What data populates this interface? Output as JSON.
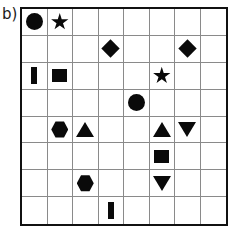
{
  "figure": {
    "panel_label": "b)",
    "grid": {
      "rows": 8,
      "columns": 8,
      "border_color": "#111111",
      "gridline_color": "#8a8a8a",
      "shape_color": "#0a0a0a",
      "background_color": "#ffffff"
    }
  },
  "chart_data": {
    "type": "heatmap",
    "title": "b)",
    "xlabel": "",
    "ylabel": "",
    "grid": true,
    "legend": "none",
    "x": [
      1,
      2,
      3,
      4,
      5,
      6,
      7,
      8
    ],
    "y": [
      1,
      2,
      3,
      4,
      5,
      6,
      7,
      8
    ],
    "xlim": [
      1,
      8
    ],
    "ylim": [
      1,
      8
    ],
    "cell_symbols": [
      [
        "circle",
        "star",
        "",
        "",
        "",
        "",
        "",
        ""
      ],
      [
        "",
        "",
        "",
        "diamond",
        "",
        "",
        "diamond",
        ""
      ],
      [
        "bar",
        "square",
        "",
        "",
        "",
        "star",
        "",
        ""
      ],
      [
        "",
        "",
        "",
        "",
        "circle",
        "",
        "",
        ""
      ],
      [
        "",
        "hexagon",
        "triangle-up",
        "",
        "",
        "triangle-up",
        "triangle-down",
        ""
      ],
      [
        "",
        "",
        "",
        "",
        "",
        "square",
        "",
        ""
      ],
      [
        "",
        "",
        "hexagon",
        "",
        "",
        "triangle-down",
        "",
        ""
      ],
      [
        "",
        "",
        "",
        "bar",
        "",
        "",
        "",
        ""
      ]
    ],
    "markers": [
      {
        "row": 1,
        "col": 1,
        "shape": "circle"
      },
      {
        "row": 1,
        "col": 2,
        "shape": "star"
      },
      {
        "row": 2,
        "col": 4,
        "shape": "diamond"
      },
      {
        "row": 2,
        "col": 7,
        "shape": "diamond"
      },
      {
        "row": 3,
        "col": 1,
        "shape": "bar"
      },
      {
        "row": 3,
        "col": 2,
        "shape": "square"
      },
      {
        "row": 3,
        "col": 6,
        "shape": "star"
      },
      {
        "row": 4,
        "col": 5,
        "shape": "circle"
      },
      {
        "row": 5,
        "col": 2,
        "shape": "hexagon"
      },
      {
        "row": 5,
        "col": 3,
        "shape": "triangle-up"
      },
      {
        "row": 5,
        "col": 6,
        "shape": "triangle-up"
      },
      {
        "row": 5,
        "col": 7,
        "shape": "triangle-down"
      },
      {
        "row": 6,
        "col": 6,
        "shape": "square"
      },
      {
        "row": 7,
        "col": 3,
        "shape": "hexagon"
      },
      {
        "row": 7,
        "col": 6,
        "shape": "triangle-down"
      },
      {
        "row": 8,
        "col": 4,
        "shape": "bar"
      }
    ],
    "shape_counts": {
      "circle": 2,
      "star": 2,
      "diamond": 2,
      "bar": 2,
      "square": 2,
      "hexagon": 2,
      "triangle-up": 2,
      "triangle-down": 2
    },
    "total_markers": 16,
    "total_cells": 64
  }
}
